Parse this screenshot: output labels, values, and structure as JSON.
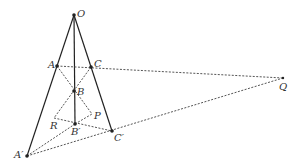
{
  "diagram": {
    "type": "geometry-perspective",
    "points": {
      "O": {
        "label": "O",
        "x": 74,
        "y": 15
      },
      "A": {
        "label": "A",
        "x": 57,
        "y": 66
      },
      "C": {
        "label": "C",
        "x": 91,
        "y": 67
      },
      "B": {
        "label": "B",
        "x": 74,
        "y": 91
      },
      "B'": {
        "label": "B′",
        "x": 75,
        "y": 124
      },
      "C'": {
        "label": "C′",
        "x": 112,
        "y": 131
      },
      "A'": {
        "label": "A′",
        "x": 27,
        "y": 156
      },
      "R": {
        "label": "R",
        "x": 54,
        "y": 118
      },
      "P": {
        "label": "P",
        "x": 92,
        "y": 114
      },
      "Q": {
        "label": "Q",
        "x": 283,
        "y": 78
      }
    },
    "solid_lines": [
      [
        "O",
        "A'"
      ],
      [
        "O",
        "B'"
      ],
      [
        "O",
        "C'"
      ]
    ],
    "dashed_lines": [
      [
        "A",
        "Q"
      ],
      [
        "A'",
        "Q"
      ],
      [
        "A",
        "P"
      ],
      [
        "C",
        "R"
      ],
      [
        "R",
        "C'"
      ],
      [
        "B",
        "P"
      ],
      [
        "B'",
        "P"
      ],
      [
        "A'",
        "B'"
      ]
    ],
    "labels": {
      "O": "O",
      "A": "A",
      "C": "C",
      "B": "B",
      "B_prime": "B′",
      "C_prime": "C′",
      "A_prime": "A′",
      "R": "R",
      "P": "P",
      "Q": "Q"
    },
    "colors": {
      "line": "#222222",
      "dashed": "#555555",
      "label": "#333333"
    }
  }
}
